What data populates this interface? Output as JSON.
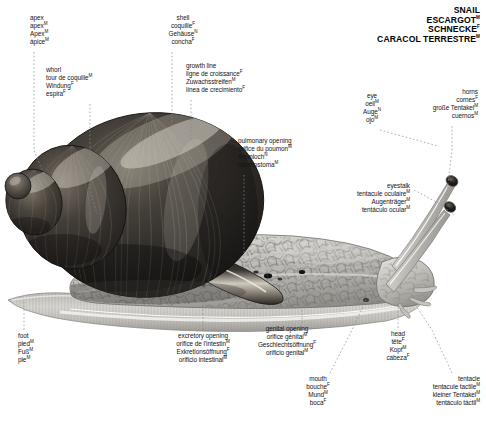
{
  "title": {
    "lines": [
      "SNAIL",
      "ESCARGOT",
      "SCHNECKE",
      "CARACOL  TERRESTRE"
    ],
    "marks": [
      "",
      "M",
      "F",
      "M"
    ]
  },
  "colors": {
    "background": "#ffffff",
    "text": "#141414",
    "leader_line": "#8a8a8a",
    "shell_dark": "#2a2724",
    "shell_mid": "#4a453f",
    "shell_light": "#9b948a",
    "body_light": "#cfcdc8",
    "body_mid": "#a9a7a2",
    "body_outline": "#6e6c68"
  },
  "labels": [
    {
      "name": "apex",
      "align": "left",
      "x": 30,
      "y": 14,
      "lines": [
        "apex",
        "apex",
        "Apex",
        "ápice"
      ],
      "marks": [
        "",
        "M",
        "M",
        "M"
      ],
      "leader": [
        [
          34,
          52
        ],
        [
          34,
          150
        ],
        [
          44,
          175
        ]
      ]
    },
    {
      "name": "whorl",
      "align": "left",
      "x": 46,
      "y": 66,
      "lines": [
        "whorl",
        "tour  de coquille",
        "Windung",
        "espira"
      ],
      "marks": [
        "",
        "M",
        "F",
        "F"
      ],
      "leader": [
        [
          90,
          104
        ],
        [
          90,
          190
        ],
        [
          97,
          214
        ]
      ]
    },
    {
      "name": "shell",
      "align": "center",
      "x": 183,
      "y": 14,
      "lines": [
        "shell",
        "coquille",
        "Gehäuse",
        "concha"
      ],
      "marks": [
        "",
        "F",
        "N",
        "F"
      ],
      "leader": [
        [
          172,
          52
        ],
        [
          172,
          126
        ]
      ]
    },
    {
      "name": "growth-line",
      "align": "left",
      "x": 186,
      "y": 62,
      "lines": [
        "growth line",
        "ligne  de croissance",
        "Zuwachsstreifen",
        "línea  de crecimiento"
      ],
      "marks": [
        "",
        "F",
        "M",
        "F"
      ],
      "leader": [
        [
          191,
          100
        ],
        [
          191,
          140
        ],
        [
          204,
          158
        ]
      ]
    },
    {
      "name": "pulmonary-opening",
      "align": "left",
      "x": 238,
      "y": 137,
      "lines": [
        "pulmonary opening",
        "orifice  du poumon",
        "Atemloch",
        "neumostoma"
      ],
      "marks": [
        "",
        "M",
        "N",
        "M"
      ],
      "leader": [
        [
          244,
          175
        ],
        [
          244,
          262
        ],
        [
          268,
          276
        ]
      ]
    },
    {
      "name": "eye",
      "align": "center",
      "x": 372,
      "y": 92,
      "lines": [
        "eye",
        "oeil",
        "Auge",
        "ojo"
      ],
      "marks": [
        "",
        "M",
        "N",
        "M"
      ],
      "leader": [
        [
          380,
          130
        ],
        [
          438,
          146
        ]
      ]
    },
    {
      "name": "horns",
      "align": "right",
      "x": 478,
      "y": 88,
      "lines": [
        "horns",
        "cornes",
        "große Tentakel",
        "cuernos"
      ],
      "marks": [
        "",
        "F",
        "M",
        "M"
      ],
      "leader": [
        [
          452,
          126
        ],
        [
          452,
          150
        ],
        [
          446,
          200
        ]
      ]
    },
    {
      "name": "eyestalk",
      "align": "right",
      "x": 410,
      "y": 182,
      "lines": [
        "eyestalk",
        "tentacule  oculaire",
        "Augenträger",
        "tentáculo  ocular"
      ],
      "marks": [
        "",
        "M",
        "M",
        "M"
      ],
      "leader": [
        [
          414,
          190
        ],
        [
          440,
          204
        ],
        [
          455,
          216
        ]
      ]
    },
    {
      "name": "foot",
      "align": "left",
      "x": 18,
      "y": 332,
      "lines": [
        "foot",
        "pied",
        "Fuß",
        "pie"
      ],
      "marks": [
        "",
        "M",
        "M",
        "M"
      ],
      "leader": [
        [
          24,
          330
        ],
        [
          24,
          300
        ]
      ]
    },
    {
      "name": "excretory-opening",
      "align": "center",
      "x": 203,
      "y": 332,
      "lines": [
        "excretory opening",
        "orifice  de l'intestin",
        "Exkretionsöffnung",
        "orificio  intestinal"
      ],
      "marks": [
        "",
        "M",
        "F",
        "M"
      ],
      "leader": [
        [
          203,
          330
        ],
        [
          203,
          300
        ]
      ]
    },
    {
      "name": "genital-opening",
      "align": "center",
      "x": 287,
      "y": 325,
      "lines": [
        "genital opening",
        "orifice  génital",
        "Geschlechtsöffnung",
        "orificio  genital"
      ],
      "marks": [
        "",
        "M",
        "F",
        "M"
      ],
      "leader": [
        [
          302,
          323
        ],
        [
          302,
          296
        ]
      ]
    },
    {
      "name": "mouth",
      "align": "center",
      "x": 318,
      "y": 375,
      "lines": [
        "mouth",
        "bouche",
        "Mund",
        "boca"
      ],
      "marks": [
        "",
        "F",
        "M",
        "F"
      ],
      "leader": [
        [
          330,
          373
        ],
        [
          352,
          330
        ],
        [
          366,
          300
        ]
      ]
    },
    {
      "name": "head",
      "align": "center",
      "x": 398,
      "y": 330,
      "lines": [
        "head",
        "tête",
        "Kopf",
        "cabeza"
      ],
      "marks": [
        "",
        "F",
        "M",
        "F"
      ],
      "leader": [
        [
          398,
          328
        ],
        [
          398,
          300
        ]
      ]
    },
    {
      "name": "tentacle",
      "align": "right",
      "x": 480,
      "y": 375,
      "lines": [
        "tentacle",
        "tentacule  tactile",
        "kleiner Tentakel",
        "tentáculo  táctil"
      ],
      "marks": [
        "",
        "M",
        "M",
        "M"
      ],
      "leader": [
        [
          452,
          373
        ],
        [
          432,
          330
        ],
        [
          412,
          300
        ]
      ]
    }
  ]
}
